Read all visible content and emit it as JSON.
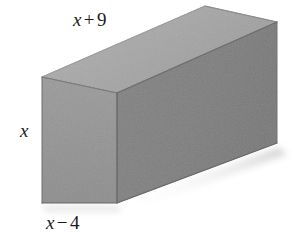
{
  "figure": {
    "name": "rectangular-prism-diagram",
    "background_color": "#ffffff",
    "shape": "rectangular prism",
    "faces": {
      "front_left": {
        "name": "front-left-face",
        "color": "#949494"
      },
      "top": {
        "name": "top-face",
        "color": "#a9a9a9"
      },
      "right_side": {
        "name": "right-side-face",
        "color": "#7f7f7f"
      }
    },
    "edge_color": "#6d6d6d",
    "shadow_color": "#d9d9d9"
  },
  "labels": {
    "top": {
      "variable": "x",
      "operator": "+",
      "number": "9"
    },
    "left": {
      "variable": "x"
    },
    "bottom": {
      "variable": "x",
      "operator": "−",
      "number": "4"
    }
  }
}
